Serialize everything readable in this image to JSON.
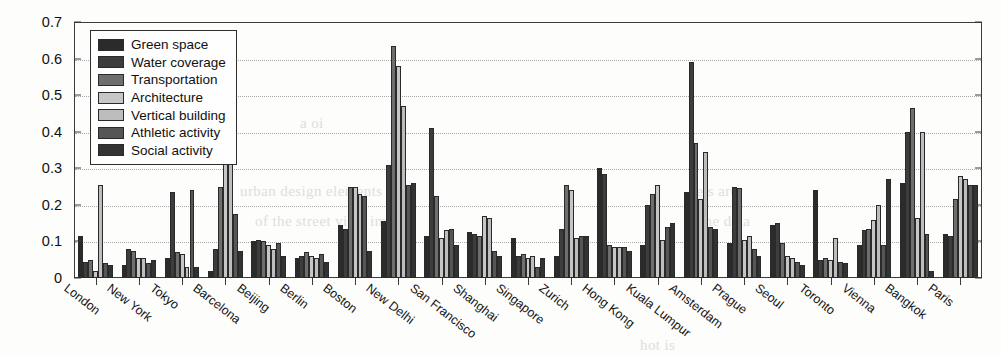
{
  "chart_data": {
    "type": "bar",
    "title": "",
    "subtitle": "",
    "xlabel": "",
    "ylabel": "",
    "ylim": [
      0,
      0.7
    ],
    "ytick_labels": [
      "0",
      "0.1",
      "0.2",
      "0.3",
      "0.4",
      "0.5",
      "0.6",
      "0.7"
    ],
    "ytick_values": [
      0,
      0.1,
      0.2,
      0.3,
      0.4,
      0.5,
      0.6,
      0.7
    ],
    "grid": true,
    "grid_axis": "y",
    "grid_style": "dotted",
    "legend_position": "upper-left",
    "orientation": "vertical",
    "grouping": "clustered",
    "categories": [
      "London",
      "New York",
      "Tokyo",
      "Barcelona",
      "Beijing",
      "Berlin",
      "Boston",
      "New Delhi",
      "San Francisco",
      "Shanghai",
      "Singapore",
      "Zurich",
      "Hong Kong",
      "Kuala Lumpur",
      "Amsterdam",
      "Prague",
      "Seoul",
      "Toronto",
      "Vienna",
      "Bangkok",
      "Paris"
    ],
    "series": [
      {
        "name": "Green space",
        "color": "#2b2b2b",
        "values": [
          0.115,
          0.035,
          0.055,
          0.02,
          0.1,
          0.055,
          0.145,
          0.155,
          0.115,
          0.125,
          0.11,
          0.06,
          0.3,
          0.09,
          0.235,
          0.095,
          0.145,
          0.24,
          0.09,
          0.26,
          0.12
        ]
      },
      {
        "name": "Water coverage",
        "color": "#3d3d3d",
        "values": [
          0.045,
          0.08,
          0.235,
          0.08,
          0.105,
          0.06,
          0.135,
          0.31,
          0.41,
          0.12,
          0.06,
          0.135,
          0.285,
          0.2,
          0.59,
          0.25,
          0.15,
          0.05,
          0.13,
          0.4,
          0.115
        ]
      },
      {
        "name": "Transportation",
        "color": "#6e6e6e",
        "values": [
          0.05,
          0.075,
          0.07,
          0.25,
          0.1,
          0.07,
          0.25,
          0.635,
          0.225,
          0.115,
          0.065,
          0.255,
          0.09,
          0.23,
          0.37,
          0.245,
          0.095,
          0.055,
          0.135,
          0.465,
          0.215
        ]
      },
      {
        "name": "Architecture",
        "color": "#c6c6c6",
        "values": [
          0.02,
          0.055,
          0.065,
          0.42,
          0.09,
          0.06,
          0.25,
          0.58,
          0.11,
          0.17,
          0.055,
          0.24,
          0.085,
          0.255,
          0.215,
          0.105,
          0.06,
          0.05,
          0.16,
          0.165,
          0.28
        ]
      },
      {
        "name": "Vertical building",
        "color": "#bdbdbd",
        "values": [
          0.255,
          0.055,
          0.03,
          0.44,
          0.08,
          0.055,
          0.23,
          0.47,
          0.13,
          0.165,
          0.06,
          0.11,
          0.085,
          0.105,
          0.345,
          0.115,
          0.055,
          0.11,
          0.2,
          0.4,
          0.27
        ]
      },
      {
        "name": "Athletic activity",
        "color": "#565656",
        "values": [
          0.04,
          0.04,
          0.24,
          0.175,
          0.095,
          0.065,
          0.225,
          0.255,
          0.135,
          0.075,
          0.03,
          0.115,
          0.085,
          0.14,
          0.14,
          0.08,
          0.045,
          0.045,
          0.09,
          0.12,
          0.255
        ]
      },
      {
        "name": "Social activity",
        "color": "#333333",
        "values": [
          0.035,
          0.05,
          0.03,
          0.075,
          0.06,
          0.045,
          0.075,
          0.26,
          0.09,
          0.06,
          0.055,
          0.115,
          0.075,
          0.15,
          0.135,
          0.06,
          0.035,
          0.04,
          0.27,
          0.02,
          0.255
        ]
      }
    ]
  },
  "legend": {
    "items": [
      {
        "label": "Green space"
      },
      {
        "label": "Water coverage"
      },
      {
        "label": "Transportation"
      },
      {
        "label": "Architecture"
      },
      {
        "label": "Vertical building"
      },
      {
        "label": "Athletic activity"
      },
      {
        "label": "Social activity"
      }
    ]
  },
  "background_text": {
    "lines": [
      "a oi",
      "urban design elements and",
      "of the street view images",
      "sets are",
      "the data",
      "hot is"
    ]
  }
}
